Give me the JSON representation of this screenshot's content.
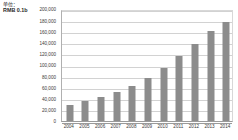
{
  "axis_unit": {
    "line1": "单位：",
    "line2": "RMB 0.1b"
  },
  "colors": {
    "bar": "#8c8c8c",
    "gridline": "#d2d2d2",
    "axis": "#9a9a9a",
    "text": "#3a3a3a",
    "background": "#ffffff"
  },
  "chart_data": {
    "type": "bar",
    "title": "",
    "subtitle": "",
    "xlabel": "",
    "ylabel": "RMB 0.1b",
    "categories": [
      "2004",
      "2005",
      "2006",
      "2007",
      "2008",
      "2009",
      "2010",
      "2011",
      "2012",
      "2013",
      "2014"
    ],
    "values": [
      29000,
      35000,
      43000,
      52000,
      62000,
      76000,
      94000,
      116000,
      137000,
      160000,
      176000
    ],
    "series": [
      {
        "name": "",
        "values": [
          29000,
          35000,
          43000,
          52000,
          62000,
          76000,
          94000,
          116000,
          137000,
          160000,
          176000
        ]
      }
    ],
    "ylim": [
      0,
      200000
    ],
    "ytick_values": [
      0,
      20000,
      40000,
      60000,
      80000,
      100000,
      120000,
      140000,
      160000,
      180000,
      200000
    ],
    "ytick_labels": [
      "0",
      "20,000",
      "40,000",
      "60,000",
      "80,000",
      "100,000",
      "120,000",
      "140,000",
      "160,000",
      "180,000",
      "200,000"
    ],
    "grid": true,
    "grid_axis": "y",
    "legend": false,
    "legend_position": "none",
    "annotations": []
  }
}
